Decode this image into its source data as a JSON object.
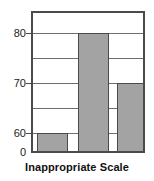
{
  "chart_data": {
    "type": "bar",
    "title": "",
    "caption": "Inappropriate Scale",
    "xlabel": "Inappropriate Scale",
    "ylabel": "",
    "categories": [
      "",
      "",
      ""
    ],
    "values": [
      60,
      80,
      70
    ],
    "series": [
      {
        "name": "",
        "values": [
          60,
          80,
          70
        ]
      }
    ],
    "ylim": [
      0,
      85
    ],
    "y_tick_labels": [
      "80",
      "70",
      "60",
      "0"
    ],
    "y_tick_values": [
      80,
      70,
      60,
      0
    ],
    "gridlines": [
      80,
      75,
      70,
      65,
      60
    ],
    "grid": true,
    "legend": "none",
    "note": "Y axis is truncated: baseline labelled 0 but scale jumps to 60",
    "colors": {
      "bar_fill": "#a3a3a3",
      "bar_stroke": "#4a4a4a",
      "frame": "#4a4a4a",
      "gridline": "#6e6e6e",
      "text": "#1c1c1c",
      "background": "#ffffff"
    }
  },
  "axis": {
    "ticks": [
      {
        "label": "80",
        "value": 80
      },
      {
        "label": "70",
        "value": 70
      },
      {
        "label": "60",
        "value": 60
      },
      {
        "label": "0",
        "value": 0
      }
    ]
  },
  "bars": [
    {
      "label": "bar-1",
      "value": 60
    },
    {
      "label": "bar-2",
      "value": 80
    },
    {
      "label": "bar-3",
      "value": 70
    }
  ],
  "caption": {
    "text": "Inappropriate Scale"
  }
}
